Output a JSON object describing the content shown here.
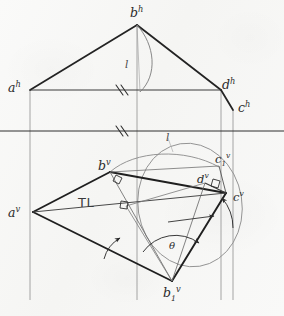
{
  "drawing": {
    "title": "Orthographic projection - true length and slope angle construction",
    "medium": "pencil on off-white paper",
    "background_color": "#f8f8f7",
    "ink_color": "#2b2b2b",
    "light_ink_color": "#6e6e6e"
  },
  "labels": {
    "a_h": {
      "base": "a",
      "sup": "h"
    },
    "b_h": {
      "base": "b",
      "sup": "h"
    },
    "c_h": {
      "base": "c",
      "sup": "h"
    },
    "d_h": {
      "base": "d",
      "sup": "h"
    },
    "a_v": {
      "base": "a",
      "sup": "v"
    },
    "b_v": {
      "base": "b",
      "sup": "v"
    },
    "c_v": {
      "base": "c",
      "sup": "v"
    },
    "d_v": {
      "base": "d",
      "sup": "v"
    },
    "c1_v": {
      "base": "c",
      "sub": "1",
      "sup": "v"
    },
    "b1_v": {
      "base": "b",
      "sub": "1",
      "sup": "v"
    },
    "true_length": "TL",
    "angle": "θ",
    "arc_radius_top": "l",
    "arc_radius_bottom": "l"
  },
  "annotations": {
    "parallel_ticks": "double hatch marks indicating parallel lines",
    "right_angle_marks": "small squares indicating perpendicularity",
    "arrowheads": "rotation direction arrows on revolution arcs"
  },
  "geometry": {
    "horizontal_view": {
      "vertices": [
        {
          "name": "a_h",
          "x": 28,
          "y": 90
        },
        {
          "name": "b_h",
          "x": 137,
          "y": 25
        },
        {
          "name": "d_h",
          "x": 222,
          "y": 90
        },
        {
          "name": "c_h",
          "x": 233,
          "y": 110
        }
      ]
    },
    "vertical_view": {
      "vertices": [
        {
          "name": "a_v",
          "x": 33,
          "y": 212
        },
        {
          "name": "b_v",
          "x": 110,
          "y": 172
        },
        {
          "name": "d_v",
          "x": 205,
          "y": 183
        },
        {
          "name": "c_v",
          "x": 226,
          "y": 193
        },
        {
          "name": "c1_v",
          "x": 219,
          "y": 166
        },
        {
          "name": "b1_v",
          "x": 172,
          "y": 281
        }
      ]
    },
    "folding_line": {
      "y": 131,
      "x1": 0,
      "x2": 284
    }
  }
}
